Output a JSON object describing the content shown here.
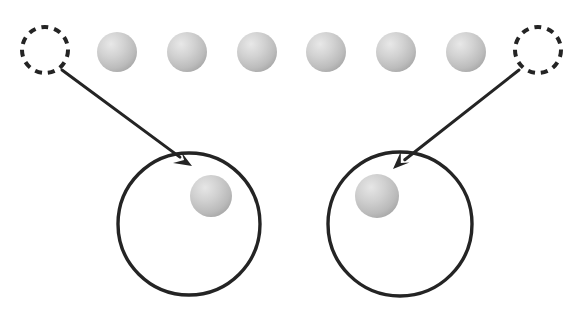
{
  "figure": {
    "type": "diagram",
    "title": "",
    "background_color": "#ffffff",
    "width": 581,
    "height": 310,
    "stroke_color": "#242424",
    "sphere_fill_light": "#e2e2e2",
    "sphere_fill_mid": "#c6c6c6",
    "sphere_fill_dark": "#a8a8a8"
  },
  "top_row": {
    "label": "row-of-spheres",
    "count": 6,
    "radius": 20,
    "center_y": 52,
    "spheres": [
      {
        "id": "top-sphere-1",
        "cx": 117,
        "cy": 52,
        "r": 20
      },
      {
        "id": "top-sphere-2",
        "cx": 187,
        "cy": 52,
        "r": 20
      },
      {
        "id": "top-sphere-3",
        "cx": 257,
        "cy": 52,
        "r": 20
      },
      {
        "id": "top-sphere-4",
        "cx": 326,
        "cy": 52,
        "r": 20
      },
      {
        "id": "top-sphere-5",
        "cx": 396,
        "cy": 52,
        "r": 20
      },
      {
        "id": "top-sphere-6",
        "cx": 466,
        "cy": 52,
        "r": 20
      }
    ]
  },
  "dashed_circles": [
    {
      "id": "dashed-circle-left",
      "cx": 45,
      "cy": 50,
      "r": 23,
      "stroke_width": 4,
      "dash": "7 6"
    },
    {
      "id": "dashed-circle-right",
      "cx": 538,
      "cy": 50,
      "r": 23,
      "stroke_width": 4,
      "dash": "7 6"
    }
  ],
  "arrows": [
    {
      "id": "arrow-left",
      "x1": 62,
      "y1": 70,
      "x2": 192,
      "y2": 166,
      "stroke_width": 3,
      "head_length": 17,
      "head_width": 9
    },
    {
      "id": "arrow-right",
      "x1": 519,
      "y1": 70,
      "x2": 393,
      "y2": 169,
      "stroke_width": 3,
      "head_length": 17,
      "head_width": 9
    }
  ],
  "big_circles": [
    {
      "id": "big-circle-left",
      "cx": 189,
      "cy": 224,
      "rx": 71,
      "ry": 71,
      "stroke_width": 3.4,
      "fill": "none"
    },
    {
      "id": "big-circle-right",
      "cx": 400,
      "cy": 224,
      "rx": 72,
      "ry": 72,
      "stroke_width": 3.4,
      "fill": "none"
    }
  ],
  "inner_spheres": [
    {
      "id": "inner-sphere-left",
      "cx": 211,
      "cy": 196,
      "r": 21
    },
    {
      "id": "inner-sphere-right",
      "cx": 377,
      "cy": 196,
      "r": 22
    }
  ]
}
